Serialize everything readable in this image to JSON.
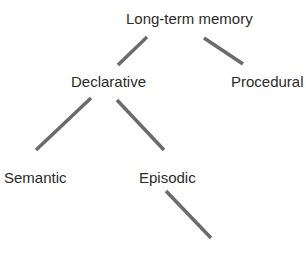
{
  "diagram": {
    "type": "tree",
    "title": "Long-term memory",
    "nodes": [
      {
        "id": "ltm",
        "label": "Long-term memory"
      },
      {
        "id": "declarative",
        "label": "Declarative"
      },
      {
        "id": "procedural",
        "label": "Procedural"
      },
      {
        "id": "semantic",
        "label": "Semantic"
      },
      {
        "id": "episodic",
        "label": "Episodic"
      }
    ],
    "edges": [
      {
        "from": "ltm",
        "to": "declarative"
      },
      {
        "from": "ltm",
        "to": "procedural"
      },
      {
        "from": "declarative",
        "to": "semantic"
      },
      {
        "from": "declarative",
        "to": "episodic"
      },
      {
        "from": "episodic",
        "to": null
      }
    ],
    "colors": {
      "edge": "#6b6b6b",
      "text": "#2b2b2b",
      "background": "#ffffff"
    }
  }
}
